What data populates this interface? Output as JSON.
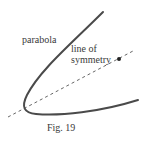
{
  "figure": {
    "caption": "Fig. 19",
    "labels": {
      "parabola": "parabola",
      "axis_line1": "line of",
      "axis_line2": "symmetry"
    },
    "colors": {
      "curve": "#4a4a4a",
      "axis": "#555555",
      "text": "#3a3a3a",
      "background": "#ffffff"
    },
    "elements": {
      "parabola_curve": "solid curve opening to the upper-right",
      "axis_of_symmetry": "dashed line through vertex",
      "focus_point": "filled dot on axis"
    }
  }
}
